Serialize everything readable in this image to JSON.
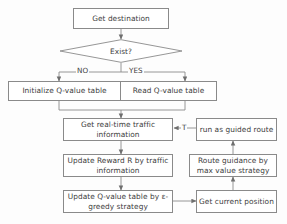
{
  "diagram": {
    "colors": {
      "stroke": "#8a8a8a",
      "text": "#3c3c3c",
      "background": "#fdfdfd",
      "node_fill": "#ffffff"
    },
    "nodes": {
      "get_destination": "Get destination",
      "exist_decision": "Exist?",
      "initialize_q_table": "Initialize Q-value table",
      "read_q_table": "Read Q-value table",
      "get_traffic_info": "Get real-time traffic information",
      "run_guided_route": "run as guided route",
      "update_reward": "Update Reward R by traffic information",
      "route_guidance": "Route guidance by max value strategy",
      "update_q_table": "Update Q-value table by ε-greedy strategy",
      "get_current_position": "Get current position"
    },
    "edge_labels": {
      "no_branch": "NO",
      "yes_branch": "YES",
      "feedback_t": "T"
    }
  }
}
